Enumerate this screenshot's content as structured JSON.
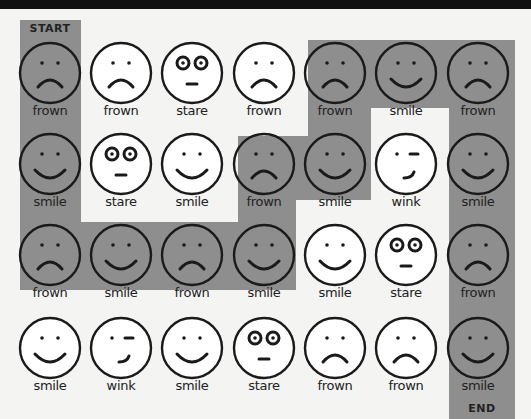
{
  "puzzle": {
    "start_label": "START",
    "end_label": "END",
    "path_color": "#8e8e8e",
    "grid": [
      [
        {
          "label": "frown",
          "face": "frown",
          "on_path": true
        },
        {
          "label": "frown",
          "face": "frown",
          "on_path": false
        },
        {
          "label": "stare",
          "face": "stare",
          "on_path": false
        },
        {
          "label": "frown",
          "face": "frown",
          "on_path": false
        },
        {
          "label": "frown",
          "face": "frown",
          "on_path": true
        },
        {
          "label": "smile",
          "face": "smile",
          "on_path": true
        },
        {
          "label": "frown",
          "face": "frown",
          "on_path": true
        }
      ],
      [
        {
          "label": "smile",
          "face": "smile",
          "on_path": true
        },
        {
          "label": "stare",
          "face": "stare",
          "on_path": false
        },
        {
          "label": "smile",
          "face": "smile",
          "on_path": false
        },
        {
          "label": "frown",
          "face": "frown",
          "on_path": true
        },
        {
          "label": "smile",
          "face": "smile",
          "on_path": true
        },
        {
          "label": "wink",
          "face": "wink",
          "on_path": false
        },
        {
          "label": "smile",
          "face": "smile",
          "on_path": true
        }
      ],
      [
        {
          "label": "frown",
          "face": "frown",
          "on_path": true
        },
        {
          "label": "smile",
          "face": "smile",
          "on_path": true
        },
        {
          "label": "frown",
          "face": "frown",
          "on_path": true
        },
        {
          "label": "smile",
          "face": "smile",
          "on_path": true
        },
        {
          "label": "smile",
          "face": "smile",
          "on_path": false
        },
        {
          "label": "stare",
          "face": "stare",
          "on_path": false
        },
        {
          "label": "frown",
          "face": "frown",
          "on_path": true
        }
      ],
      [
        {
          "label": "smile",
          "face": "smile",
          "on_path": false
        },
        {
          "label": "wink",
          "face": "wink",
          "on_path": false
        },
        {
          "label": "smile",
          "face": "smile",
          "on_path": false
        },
        {
          "label": "stare",
          "face": "stare",
          "on_path": false
        },
        {
          "label": "frown",
          "face": "frown",
          "on_path": false
        },
        {
          "label": "frown",
          "face": "frown",
          "on_path": false
        },
        {
          "label": "smile",
          "face": "smile",
          "on_path": true
        }
      ]
    ]
  }
}
